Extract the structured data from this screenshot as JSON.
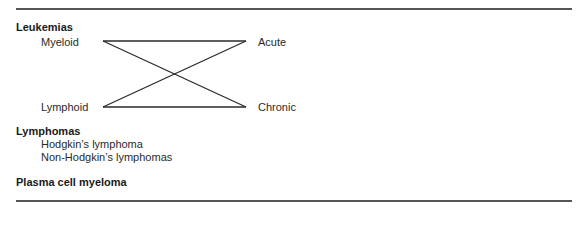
{
  "sections": {
    "leukemias": {
      "heading": "Leukemias",
      "diagram": {
        "left_labels": [
          "Myeloid",
          "Lymphoid"
        ],
        "right_labels": [
          "Acute",
          "Chronic"
        ],
        "line_color": "#2a2a2a"
      }
    },
    "lymphomas": {
      "heading": "Lymphomas",
      "items": [
        "Hodgkin’s lymphoma",
        "Non-Hodgkin’s lymphomas"
      ]
    },
    "plasma": {
      "heading": "Plasma cell myeloma"
    }
  }
}
